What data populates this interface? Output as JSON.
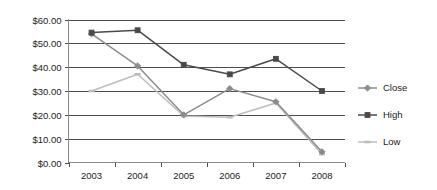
{
  "chart_data": {
    "type": "line",
    "title": "",
    "xlabel": "",
    "ylabel": "",
    "categories": [
      "2003",
      "2004",
      "2005",
      "2006",
      "2007",
      "2008"
    ],
    "ylim": [
      0,
      60
    ],
    "ytick_step": 10,
    "ytick_labels": [
      "$0.00",
      "$10.00",
      "$20.00",
      "$30.00",
      "$40.00",
      "$50.00",
      "$60.00"
    ],
    "ytick_values": [
      0,
      10,
      20,
      30,
      40,
      50,
      60
    ],
    "grid": "horizontal",
    "legend_position": "right",
    "series": [
      {
        "name": "Close",
        "color": "#8c8c8c",
        "marker": "diamond",
        "values": [
          54.0,
          40.5,
          20.0,
          31.0,
          25.5,
          4.5
        ]
      },
      {
        "name": "High",
        "color": "#4a4a4a",
        "marker": "square",
        "values": [
          54.5,
          55.5,
          41.0,
          37.0,
          43.5,
          30.0
        ]
      },
      {
        "name": "Low",
        "color": "#bdbdbd",
        "marker": "dash",
        "values": [
          30.0,
          37.0,
          19.5,
          19.0,
          25.0,
          3.5
        ]
      }
    ]
  },
  "legend": {
    "items": [
      {
        "label": "Close"
      },
      {
        "label": "High"
      },
      {
        "label": "Low"
      }
    ]
  },
  "axes": {
    "y_labels": [
      "$60.00",
      "$50.00",
      "$40.00",
      "$30.00",
      "$20.00",
      "$10.00",
      "$0.00"
    ],
    "x_labels": [
      "2003",
      "2004",
      "2005",
      "2006",
      "2007",
      "2008"
    ]
  }
}
